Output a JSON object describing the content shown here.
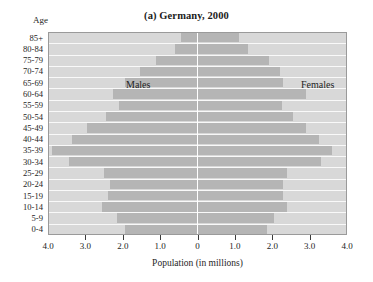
{
  "chart": {
    "title": "(a) Germany, 2000",
    "age_header": "Age",
    "xaxis_title": "Population (in millions)",
    "male_label": "Males",
    "female_label": "Females"
  },
  "colors": {
    "plot_background": "#d8d8d8",
    "bar": "#b5b5b5",
    "separator": "#fbfbfb",
    "center_axis": "#ffffff",
    "border": "#9a9a9a",
    "text": "#242424"
  },
  "chart_data": {
    "type": "bar",
    "subtype": "population-pyramid",
    "title": "(a) Germany, 2000",
    "xlabel": "Population (in millions)",
    "ylabel": "Age",
    "xlim": [
      -4.0,
      4.0
    ],
    "xticks": [
      -4.0,
      -3.0,
      -2.0,
      -1.0,
      0,
      1.0,
      2.0,
      3.0,
      4.0
    ],
    "xticklabels": [
      "4.0",
      "3.0",
      "2.0",
      "1.0",
      "0",
      "1.0",
      "2.0",
      "3.0",
      "4.0"
    ],
    "grid": false,
    "legend_position": "inside-top",
    "categories": [
      "85+",
      "80-84",
      "75-79",
      "70-74",
      "65-69",
      "60-64",
      "55-59",
      "50-54",
      "45-49",
      "40-44",
      "35-39",
      "30-34",
      "25-29",
      "20-24",
      "15-19",
      "10-14",
      "5-9",
      "0-4"
    ],
    "series": [
      {
        "name": "Males",
        "side": "left",
        "values": [
          0.45,
          0.6,
          1.1,
          1.55,
          1.95,
          2.25,
          2.1,
          2.45,
          2.95,
          3.35,
          3.9,
          3.45,
          2.5,
          2.35,
          2.4,
          2.55,
          2.15,
          1.95
        ]
      },
      {
        "name": "Females",
        "side": "right",
        "values": [
          1.1,
          1.35,
          1.9,
          2.2,
          2.3,
          2.9,
          2.25,
          2.55,
          2.9,
          3.25,
          3.6,
          3.3,
          2.4,
          2.3,
          2.3,
          2.4,
          2.05,
          1.85
        ]
      }
    ]
  }
}
